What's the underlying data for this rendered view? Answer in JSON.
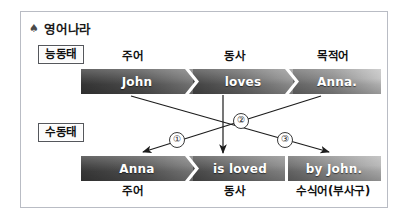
{
  "page": {
    "title": "영어나라",
    "title_icon": "spade-icon"
  },
  "voice_labels": {
    "active": "능동태",
    "passive": "수동태"
  },
  "active_clause": {
    "roles": [
      "주어",
      "동사",
      "목적어"
    ],
    "segments": [
      "John",
      "loves",
      "Anna."
    ]
  },
  "passive_clause": {
    "segments": [
      "Anna",
      "is loved",
      "by John."
    ],
    "roles": [
      "주어",
      "동사",
      "수식어(부사구)"
    ]
  },
  "mapping_markers": {
    "one": "①",
    "two": "②",
    "three": "③"
  },
  "colors": {
    "frame_border": "#b9bcc4",
    "bar_dark": "#3a3a3a",
    "bar_light": "#c2c2c2",
    "bar_text": "#ffffff",
    "arrow": "#1c1c1c",
    "label_text": "#111111"
  }
}
